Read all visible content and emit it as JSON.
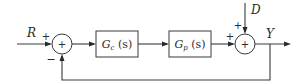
{
  "diagram": {
    "type": "block-diagram",
    "signals": {
      "reference": "R",
      "disturbance": "D",
      "output": "Y"
    },
    "blocks": [
      {
        "id": "controller",
        "label_main": "G",
        "label_sub": "c",
        "label_arg": " (s)"
      },
      {
        "id": "plant",
        "label_main": "G",
        "label_sub": "p",
        "label_arg": " (s)"
      }
    ],
    "summing_junctions": [
      {
        "id": "sum1",
        "center": "+",
        "input_signs": {
          "reference": "+",
          "feedback": "−"
        }
      },
      {
        "id": "sum2",
        "center": "+",
        "input_signs": {
          "plant": "+",
          "disturbance": "+"
        }
      }
    ]
  }
}
